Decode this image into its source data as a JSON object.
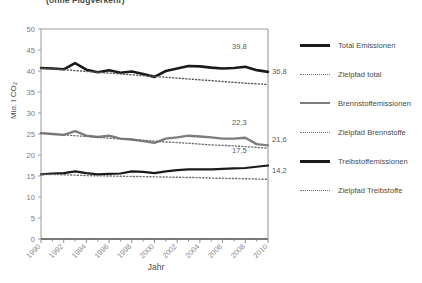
{
  "figure": {
    "title_fragment": "(ohne Flugverkehr)"
  },
  "chart_data": {
    "type": "line",
    "title": "(ohne Flugverkehr)",
    "xlabel": "Jahr",
    "ylabel": "Mio. t CO2",
    "ylabel_parts": {
      "main": "Mio. t CO",
      "sub": "2"
    },
    "xlim": [
      1990,
      2010
    ],
    "ylim": [
      0,
      50
    ],
    "yticks": [
      0,
      5,
      10,
      15,
      20,
      25,
      30,
      35,
      40,
      45,
      50
    ],
    "xticks": [
      1990,
      1992,
      1994,
      1996,
      1998,
      2000,
      2002,
      2004,
      2006,
      2008,
      2010
    ],
    "xtick_labels": [
      "1990",
      "1992",
      "1994",
      "1996",
      "1998",
      "2000",
      "2002",
      "2004",
      "2006",
      "2008",
      "2010"
    ],
    "ytick_labels": [
      "0",
      "5",
      "10",
      "15",
      "20",
      "25",
      "30",
      "35",
      "40",
      "45",
      "50"
    ],
    "grid": false,
    "legend_position": "right",
    "x": [
      1990,
      1991,
      1992,
      1993,
      1994,
      1995,
      1996,
      1997,
      1998,
      1999,
      2000,
      2001,
      2002,
      2003,
      2004,
      2005,
      2006,
      2007,
      2008,
      2009,
      2010
    ],
    "series": [
      {
        "name": "Total Emissionen",
        "key": "total_emissionen",
        "style": "solid",
        "color": "#1a1a1a",
        "width": 2.6,
        "end_label": "39,8",
        "end_value": 39.8,
        "values": [
          40.7,
          40.6,
          40.4,
          41.9,
          40.3,
          39.7,
          40.2,
          39.6,
          39.9,
          39.3,
          38.6,
          40.0,
          40.6,
          41.2,
          41.1,
          40.8,
          40.6,
          40.7,
          41.0,
          40.2,
          39.8
        ]
      },
      {
        "name": "Zielpfad total",
        "key": "zielpfad_total",
        "style": "dotted",
        "color": "#5a5a5a",
        "width": 1.4,
        "end_label": "36,8",
        "end_value": 36.8,
        "values": [
          40.7,
          40.5,
          40.3,
          40.1,
          39.9,
          39.7,
          39.5,
          39.3,
          39.1,
          38.9,
          38.7,
          38.5,
          38.3,
          38.1,
          37.9,
          37.7,
          37.5,
          37.3,
          37.1,
          36.95,
          36.8
        ]
      },
      {
        "name": "Brennstoffemissionen",
        "key": "brennstoffemissionen",
        "style": "solid",
        "color": "#7d7d7d",
        "width": 2.4,
        "end_label": "22,3",
        "end_value": 22.3,
        "values": [
          25.2,
          25.0,
          24.8,
          25.7,
          24.6,
          24.3,
          24.6,
          23.9,
          23.7,
          23.3,
          22.9,
          23.9,
          24.2,
          24.6,
          24.4,
          24.2,
          23.9,
          23.9,
          24.1,
          22.6,
          22.3
        ]
      },
      {
        "name": "Zielpfad Brennstoffe",
        "key": "zielpfad_brennstoffe",
        "style": "dotted",
        "color": "#6e6e6e",
        "width": 1.4,
        "end_label": "21,6",
        "end_value": 21.6,
        "values": [
          25.2,
          25.0,
          24.8,
          24.6,
          24.4,
          24.2,
          24.0,
          23.85,
          23.7,
          23.5,
          23.3,
          23.1,
          22.95,
          22.8,
          22.6,
          22.4,
          22.3,
          22.15,
          22.0,
          21.8,
          21.6
        ]
      },
      {
        "name": "Treibstoffemissionen",
        "key": "treibstoffemissionen",
        "style": "solid",
        "color": "#1a1a1a",
        "width": 2.2,
        "end_label": "17,5",
        "end_value": 17.5,
        "values": [
          15.4,
          15.6,
          15.7,
          16.1,
          15.7,
          15.4,
          15.5,
          15.6,
          16.1,
          16.0,
          15.7,
          16.1,
          16.4,
          16.6,
          16.6,
          16.6,
          16.7,
          16.8,
          16.9,
          17.2,
          17.5
        ]
      },
      {
        "name": "Zielpfad Treibstoffe",
        "key": "zielpfad_treibstoffe",
        "style": "dotted",
        "color": "#6e6e6e",
        "width": 1.4,
        "end_label": "14,2",
        "end_value": 14.2,
        "values": [
          15.4,
          15.35,
          15.3,
          15.2,
          15.1,
          15.05,
          15.0,
          14.95,
          14.9,
          14.85,
          14.8,
          14.75,
          14.7,
          14.65,
          14.6,
          14.5,
          14.45,
          14.4,
          14.35,
          14.28,
          14.2
        ]
      }
    ],
    "legend": [
      {
        "label": "Total Emissionen",
        "style": "solid",
        "color": "#1a1a1a"
      },
      {
        "label": "Zielpfad total",
        "style": "dotted",
        "color": "#6e6e6e"
      },
      {
        "label": "Brennstoffemissionen",
        "style": "solid",
        "color": "#7d7d7d"
      },
      {
        "label": "Zielpfad Brennstoffe",
        "style": "dotted",
        "color": "#6e6e6e"
      },
      {
        "label": "Treibstoffemissionen",
        "style": "solid",
        "color": "#1a1a1a"
      },
      {
        "label": "Zielpfad Treibstoffe",
        "style": "dotted",
        "color": "#6e6e6e"
      }
    ]
  }
}
